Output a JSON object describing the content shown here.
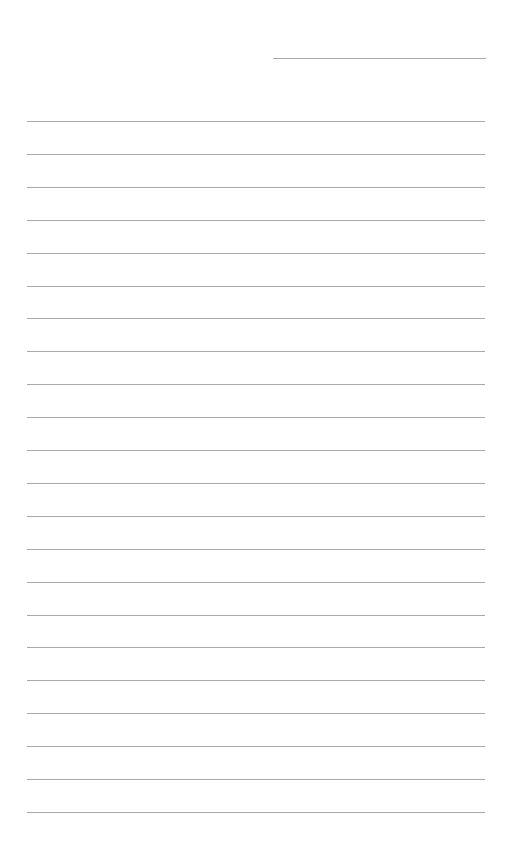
{
  "page": {
    "type": "lined-paper",
    "header_line": {
      "x": 273,
      "y": 58,
      "width": 213,
      "color": "#a9a9a9"
    },
    "ruled_lines": {
      "count": 22,
      "x": 27,
      "width": 458,
      "first_y": 121,
      "spacing": 32.9,
      "color": "#a9a9a9"
    },
    "background_color": "#ffffff"
  }
}
